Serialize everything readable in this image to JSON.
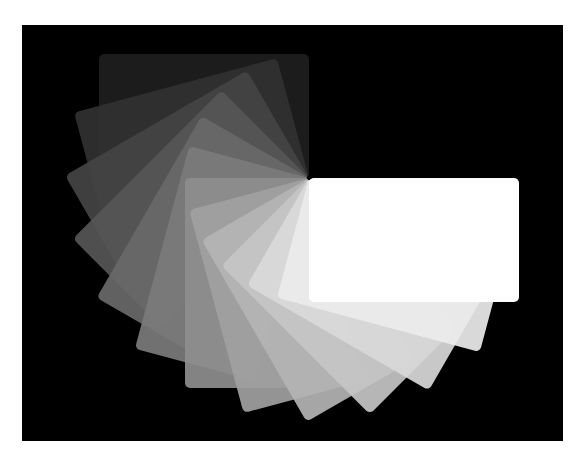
{
  "image": {
    "description": "Fan of rounded rectangular cards rotating around a shared corner, graded from near-black to white on a black background",
    "background": "#000000",
    "frame_border": "#ffffff"
  },
  "fan": {
    "pivot": [
      309,
      178
    ],
    "card_size": [
      210,
      124
    ],
    "step_degrees": 15,
    "cards": [
      {
        "angle": 180,
        "color": "#1e1e1e"
      },
      {
        "angle": 165,
        "color": "#313131"
      },
      {
        "angle": 150,
        "color": "#444444"
      },
      {
        "angle": 135,
        "color": "#565656"
      },
      {
        "angle": 120,
        "color": "#696969"
      },
      {
        "angle": 105,
        "color": "#7b7b7b"
      },
      {
        "angle": 90,
        "color": "#8e8e8e"
      },
      {
        "angle": 75,
        "color": "#a1a1a1"
      },
      {
        "angle": 60,
        "color": "#b4b4b4"
      },
      {
        "angle": 45,
        "color": "#c6c6c6"
      },
      {
        "angle": 30,
        "color": "#d9d9d9"
      },
      {
        "angle": 15,
        "color": "#ececec"
      },
      {
        "angle": 0,
        "color": "#ffffff"
      }
    ]
  }
}
